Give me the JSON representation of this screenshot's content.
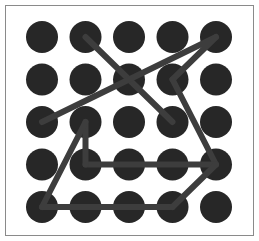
{
  "app": {
    "title": "Pattern Lock Grid",
    "width": 259,
    "height": 241
  },
  "frame": {
    "name": "pattern-frame",
    "border_color": "#8a8a8a",
    "background_color": "#ffffff",
    "x": 5,
    "y": 5,
    "width": 249,
    "height": 231,
    "border_width": 1
  },
  "grid": {
    "rows": 5,
    "cols": 5,
    "node_count": 25,
    "origin_x": 42,
    "origin_y": 37,
    "spacing_x": 43.5,
    "spacing_y": 42.5,
    "node_radius": 16,
    "node_color": "#272727",
    "label": "5 by 5 dot grid"
  },
  "path": {
    "stroke_color": "#3d3d3d",
    "stroke_width": 6,
    "line_cap": "round",
    "line_join": "round",
    "segment_count": 9,
    "segments": [
      {
        "name": "segment-1",
        "from": {
          "row": 1,
          "col": 2
        },
        "to": {
          "row": 3,
          "col": 4
        }
      },
      {
        "name": "segment-2",
        "from": {
          "row": 1,
          "col": 5
        },
        "to": {
          "row": 3,
          "col": 1
        }
      },
      {
        "name": "segment-3",
        "from": {
          "row": 1,
          "col": 5
        },
        "to": {
          "row": 2,
          "col": 4
        }
      },
      {
        "name": "segment-4",
        "from": {
          "row": 2,
          "col": 4
        },
        "to": {
          "row": 4,
          "col": 5
        }
      },
      {
        "name": "segment-5",
        "from": {
          "row": 4,
          "col": 5
        },
        "to": {
          "row": 4,
          "col": 2
        }
      },
      {
        "name": "segment-6",
        "from": {
          "row": 4,
          "col": 2
        },
        "to": {
          "row": 3,
          "col": 2
        }
      },
      {
        "name": "segment-7",
        "from": {
          "row": 3,
          "col": 2
        },
        "to": {
          "row": 5,
          "col": 1
        }
      },
      {
        "name": "segment-8",
        "from": {
          "row": 5,
          "col": 1
        },
        "to": {
          "row": 5,
          "col": 4
        }
      },
      {
        "name": "segment-9",
        "from": {
          "row": 5,
          "col": 4
        },
        "to": {
          "row": 4,
          "col": 5
        }
      }
    ]
  },
  "nodes": [
    {
      "row": 1,
      "col": 1,
      "name": "node-r1c1",
      "on_path": false
    },
    {
      "row": 1,
      "col": 2,
      "name": "node-r1c2",
      "on_path": true
    },
    {
      "row": 1,
      "col": 3,
      "name": "node-r1c3",
      "on_path": false
    },
    {
      "row": 1,
      "col": 4,
      "name": "node-r1c4",
      "on_path": false
    },
    {
      "row": 1,
      "col": 5,
      "name": "node-r1c5",
      "on_path": true
    },
    {
      "row": 2,
      "col": 1,
      "name": "node-r2c1",
      "on_path": false
    },
    {
      "row": 2,
      "col": 2,
      "name": "node-r2c2",
      "on_path": false
    },
    {
      "row": 2,
      "col": 3,
      "name": "node-r2c3",
      "on_path": false
    },
    {
      "row": 2,
      "col": 4,
      "name": "node-r2c4",
      "on_path": true
    },
    {
      "row": 2,
      "col": 5,
      "name": "node-r2c5",
      "on_path": false
    },
    {
      "row": 3,
      "col": 1,
      "name": "node-r3c1",
      "on_path": true
    },
    {
      "row": 3,
      "col": 2,
      "name": "node-r3c2",
      "on_path": true
    },
    {
      "row": 3,
      "col": 3,
      "name": "node-r3c3",
      "on_path": false
    },
    {
      "row": 3,
      "col": 4,
      "name": "node-r3c4",
      "on_path": true
    },
    {
      "row": 3,
      "col": 5,
      "name": "node-r3c5",
      "on_path": false
    },
    {
      "row": 4,
      "col": 1,
      "name": "node-r4c1",
      "on_path": false
    },
    {
      "row": 4,
      "col": 2,
      "name": "node-r4c2",
      "on_path": true
    },
    {
      "row": 4,
      "col": 3,
      "name": "node-r4c3",
      "on_path": true
    },
    {
      "row": 4,
      "col": 4,
      "name": "node-r4c4",
      "on_path": true
    },
    {
      "row": 4,
      "col": 5,
      "name": "node-r4c5",
      "on_path": true
    },
    {
      "row": 5,
      "col": 1,
      "name": "node-r5c1",
      "on_path": true
    },
    {
      "row": 5,
      "col": 2,
      "name": "node-r5c2",
      "on_path": true
    },
    {
      "row": 5,
      "col": 3,
      "name": "node-r5c3",
      "on_path": true
    },
    {
      "row": 5,
      "col": 4,
      "name": "node-r5c4",
      "on_path": true
    },
    {
      "row": 5,
      "col": 5,
      "name": "node-r5c5",
      "on_path": false
    }
  ]
}
